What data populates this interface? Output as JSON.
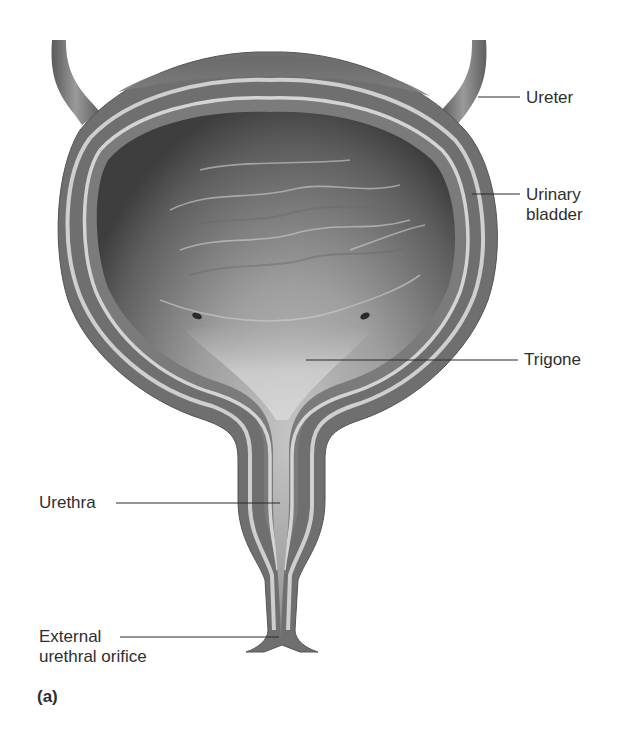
{
  "figure": {
    "panel_label": "(a)",
    "labels": [
      {
        "id": "ureter",
        "text": "Ureter"
      },
      {
        "id": "urinary-bladder",
        "line1": "Urinary",
        "line2": "bladder"
      },
      {
        "id": "trigone",
        "text": "Trigone"
      },
      {
        "id": "urethra",
        "text": "Urethra"
      },
      {
        "id": "external-urethral-orifice",
        "line1": "External",
        "line2": "urethral orifice"
      }
    ]
  },
  "colors": {
    "background": "#ffffff",
    "outer_wall": "#6e6e6e",
    "muscle_layer": "#7d7d7d",
    "lining_stripe": "#c9c9c9",
    "lumen_dark": "#4a4a4a",
    "lumen_light": "#bdbdbd",
    "leader_line": "#2b2b2b",
    "text": "#2e2e2e"
  }
}
